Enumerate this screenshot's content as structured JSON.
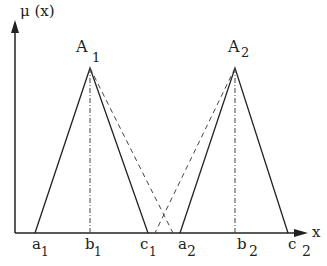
{
  "diagram": {
    "y_axis_label": "μ (x)",
    "x_axis_label": "x",
    "sets": [
      {
        "name": "A",
        "sub": "1",
        "a": "a",
        "a_sub": "1",
        "b": "b",
        "b_sub": "1",
        "c": "c",
        "c_sub": "1"
      },
      {
        "name": "A",
        "sub": "2",
        "a": "a",
        "a_sub": "2",
        "b": "b",
        "b_sub": "2",
        "c": "c",
        "c_sub": "2"
      }
    ],
    "colors": {
      "line": "#222222",
      "background": "#ffffff"
    }
  }
}
